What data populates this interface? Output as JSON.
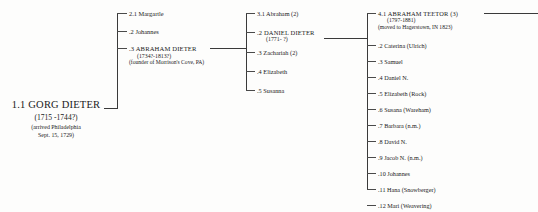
{
  "chart": {
    "line_color": "#3a3a3a"
  },
  "generation1": {
    "person": {
      "name": "1.1 GORG DIETER",
      "dates": "(1715 -1744?)",
      "note_line1": "(arrived Philadelphia",
      "note_line2": "Sept. 15, 1729)"
    }
  },
  "generation2": {
    "children": [
      {
        "name": "2.1 Margartle"
      },
      {
        "name": ".2 Johannes"
      },
      {
        "name": ".3 ABRAHAM DIETER",
        "dates": "(1734?-1813?)",
        "note": "(founder of Morrison's Cove, PA)"
      }
    ]
  },
  "generation3": {
    "children": [
      {
        "name": "3.1 Abraham (2)"
      },
      {
        "name": ".2 DANIEL DIETER",
        "dates": "(1771- ?)"
      },
      {
        "name": ".3 Zachariah (2)"
      },
      {
        "name": ".4 Elizabeth"
      },
      {
        "name": ".5 Susanna"
      }
    ]
  },
  "generation4": {
    "children": [
      {
        "name": "4.1 ABRAHAM TEETOR (3)",
        "dates": "(1797-1881)",
        "note": "(moved to Hagerstown, IN 1823)"
      },
      {
        "name": ".2 Caterina (Ulrich)"
      },
      {
        "name": ".3 Samuel"
      },
      {
        "name": ".4 Daniel N."
      },
      {
        "name": ".5 Elizabeth (Rock)"
      },
      {
        "name": ".6 Susana (Wareham)"
      },
      {
        "name": ".7 Barbara (n.m.)"
      },
      {
        "name": ".8 David N."
      },
      {
        "name": ".9 Jacob N. (n.m.)"
      },
      {
        "name": ".10 Johannes"
      },
      {
        "name": ".11 Hana (Snowberger)"
      },
      {
        "name": ".12 Mari (Weavering)"
      }
    ]
  }
}
